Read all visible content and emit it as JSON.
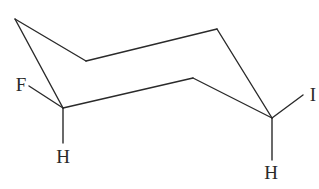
{
  "diagram": {
    "type": "chair-conformation",
    "molecule": "1-fluoro-4-iodocyclohexane (chair conformation)",
    "atoms": {
      "fluorine": {
        "label": "F",
        "x": 21,
        "y": 91
      },
      "hydrogen_left": {
        "label": "H",
        "x": 63,
        "y": 163
      },
      "iodine": {
        "label": "I",
        "x": 313,
        "y": 101
      },
      "hydrogen_right": {
        "label": "H",
        "x": 271,
        "y": 179
      }
    },
    "ring_vertices": [
      {
        "name": "left-tip",
        "x": 15,
        "y": 19
      },
      {
        "name": "upper-left",
        "x": 86,
        "y": 61
      },
      {
        "name": "top-right",
        "x": 217,
        "y": 29
      },
      {
        "name": "right-carbon",
        "x": 272,
        "y": 118
      },
      {
        "name": "lower-right",
        "x": 193,
        "y": 78
      },
      {
        "name": "left-carbon",
        "x": 63,
        "y": 108
      }
    ],
    "substituent_bonds": [
      {
        "from": "left-carbon",
        "to": "F",
        "x1": 63,
        "y1": 108,
        "x2": 29,
        "y2": 86
      },
      {
        "from": "left-carbon",
        "to": "H",
        "x1": 63,
        "y1": 108,
        "x2": 63,
        "y2": 143
      },
      {
        "from": "right-carbon",
        "to": "I",
        "x1": 272,
        "y1": 118,
        "x2": 303,
        "y2": 95
      },
      {
        "from": "right-carbon",
        "to": "H",
        "x1": 272,
        "y1": 118,
        "x2": 272,
        "y2": 160
      }
    ],
    "colors": {
      "line": "#2a2a2a",
      "background": "#ffffff"
    }
  }
}
